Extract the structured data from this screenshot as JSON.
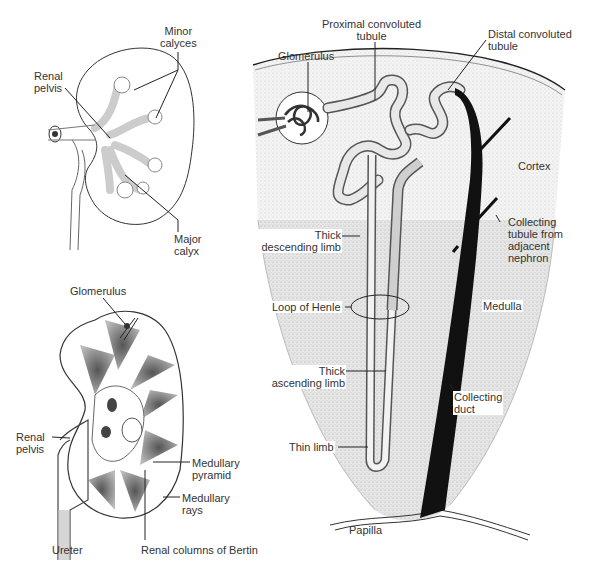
{
  "figure": {
    "panels": [
      {
        "id": "kidney-exterior",
        "labels": {
          "minor_calyces": "Minor\ncalyces",
          "renal_pelvis": "Renal\npelvis",
          "major_calyx": "Major\ncalyx"
        }
      },
      {
        "id": "kidney-section",
        "labels": {
          "glomerulus": "Glomerulus",
          "renal_pelvis": "Renal\npelvis",
          "medullary_pyramid": "Medullary\npyramid",
          "medullary_rays": "Medullary\nrays",
          "ureter": "Ureter",
          "renal_columns": "Renal columns of Bertin"
        }
      },
      {
        "id": "nephron",
        "labels": {
          "proximal_convoluted_tubule": "Proximal convoluted\ntubule",
          "distal_convoluted_tubule": "Distal convoluted\ntubule",
          "glomerulus": "Glomerulus",
          "cortex": "Cortex",
          "collecting_tubule": "Collecting\ntubule from\nadjacent\nnephron",
          "thick_descending_limb": "Thick\ndescending limb",
          "loop_of_henle": "Loop of Henle",
          "medulla": "Medulla",
          "thick_ascending_limb": "Thick\nascending limb",
          "collecting_duct": "Collecting\nduct",
          "thin_limb": "Thin limb",
          "papilla": "Papilla"
        }
      }
    ]
  }
}
